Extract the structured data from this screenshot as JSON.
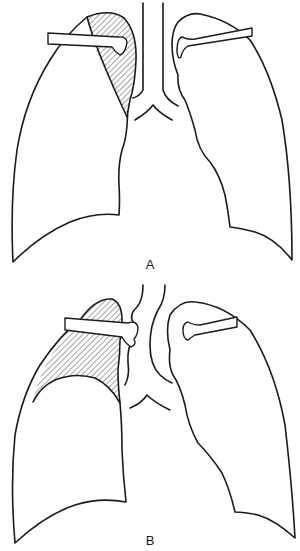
{
  "figure": {
    "panels": [
      {
        "id": "A",
        "label": "A",
        "description": "Chest outline with hatched opacity in right upper lobe (medial apex)"
      },
      {
        "id": "B",
        "label": "B",
        "description": "Chest outline with hatched opacity of right upper lobe bounded by curved lower border; trachea deviated"
      }
    ]
  },
  "colors": {
    "ink": "#1a1a1a",
    "background": "#ffffff"
  }
}
